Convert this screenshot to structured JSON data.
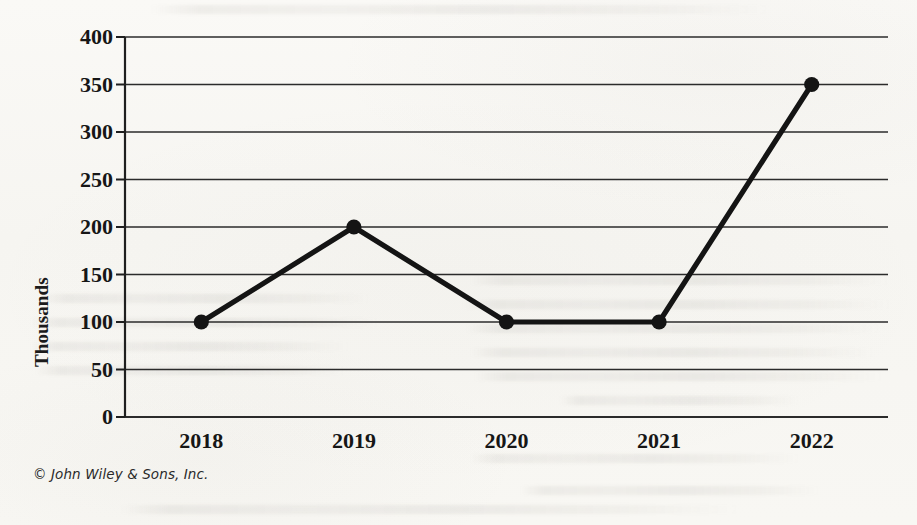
{
  "figure": {
    "copyright": "© John Wiley & Sons, Inc."
  },
  "chart_data": {
    "type": "line",
    "title": "",
    "subtitle": "",
    "xlabel": "",
    "ylabel": "Thousands",
    "categories": [
      "2018",
      "2019",
      "2020",
      "2021",
      "2022"
    ],
    "values": [
      100,
      200,
      100,
      100,
      350
    ],
    "series": [
      {
        "name": "",
        "values": [
          100,
          200,
          100,
          100,
          350
        ]
      }
    ],
    "ylim": [
      0,
      400
    ],
    "ytick_labels": [
      "0",
      "50",
      "100",
      "150",
      "200",
      "250",
      "300",
      "350",
      "400"
    ],
    "ytick_values": [
      0,
      50,
      100,
      150,
      200,
      250,
      300,
      350,
      400
    ],
    "ytick_step": 50,
    "grid": "horizontal",
    "legend": "none",
    "marker": "circle-filled",
    "line_color": "#141414",
    "grid_color": "#2b2b2b",
    "axis_color": "#1f1f1f",
    "background_color": "#f8f7f4",
    "annotations": []
  }
}
